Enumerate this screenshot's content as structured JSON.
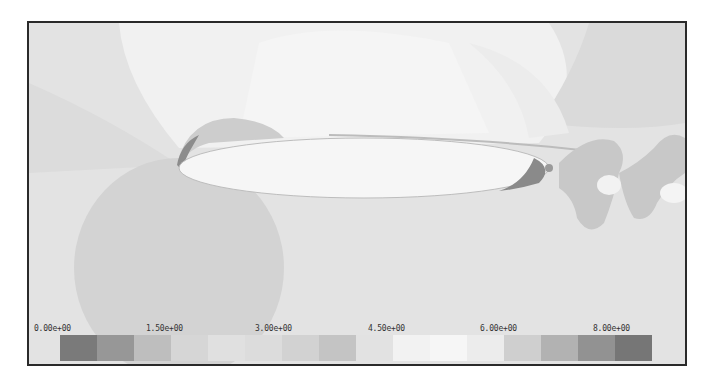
{
  "chart_data": {
    "type": "heatmap",
    "title": "",
    "colorbar": {
      "orientation": "horizontal",
      "position": "bottom",
      "range": [
        0.0,
        8.0
      ],
      "tick_labels": [
        "0.00e+00",
        "1.50e+00",
        "3.00e+00",
        "4.50e+00",
        "6.00e+00",
        "8.00e+00"
      ],
      "tick_values": [
        0.0,
        1.5,
        3.0,
        4.5,
        6.0,
        8.0
      ],
      "bins": 16,
      "bin_colors": [
        "#7a7a7a",
        "#979797",
        "#bebebe",
        "#d6d6d6",
        "#e0e0e0",
        "#dcdcdc",
        "#d2d2d2",
        "#c4c4c4",
        "#e2e2e2",
        "#f2f2f2",
        "#f6f6f6",
        "#ececec",
        "#cfcfcf",
        "#b2b2b2",
        "#929292",
        "#767676"
      ]
    },
    "regions": [
      {
        "name": "background",
        "color": "#e4e4e4"
      },
      {
        "name": "upper-bright-arc",
        "color": "#f3f3f3"
      },
      {
        "name": "airfoil-body",
        "color": "#f5f5f5"
      },
      {
        "name": "leading-edge-low-region",
        "color": "#cfcfcf"
      },
      {
        "name": "lower-circle-region",
        "color": "#d2d2d2"
      },
      {
        "name": "upper-right-band",
        "color": "#d8d8d8"
      },
      {
        "name": "wake-vortices",
        "color": "#c8c8c8"
      }
    ],
    "xlabel": "",
    "ylabel": "",
    "grid": false
  },
  "colorbar": {
    "labels": [
      "0.00e+00",
      "1.50e+00",
      "3.00e+00",
      "4.50e+00",
      "6.00e+00",
      "8.00e+00"
    ]
  }
}
